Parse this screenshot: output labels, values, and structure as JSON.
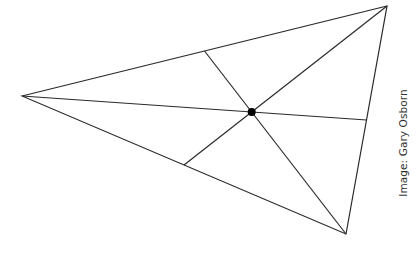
{
  "diagram": {
    "vertices": {
      "A": [
        22,
        96
      ],
      "B": [
        387,
        6
      ],
      "C": [
        346,
        234
      ]
    },
    "midpoints": {
      "AB": [
        204.5,
        51
      ],
      "BC": [
        366.5,
        120
      ],
      "AC": [
        184,
        165
      ]
    },
    "centroid": [
      251.7,
      112
    ],
    "stroke_color": "#2a2a2a",
    "point_color": "#000000"
  },
  "credit": {
    "text": "Image: Gary Osborn"
  }
}
